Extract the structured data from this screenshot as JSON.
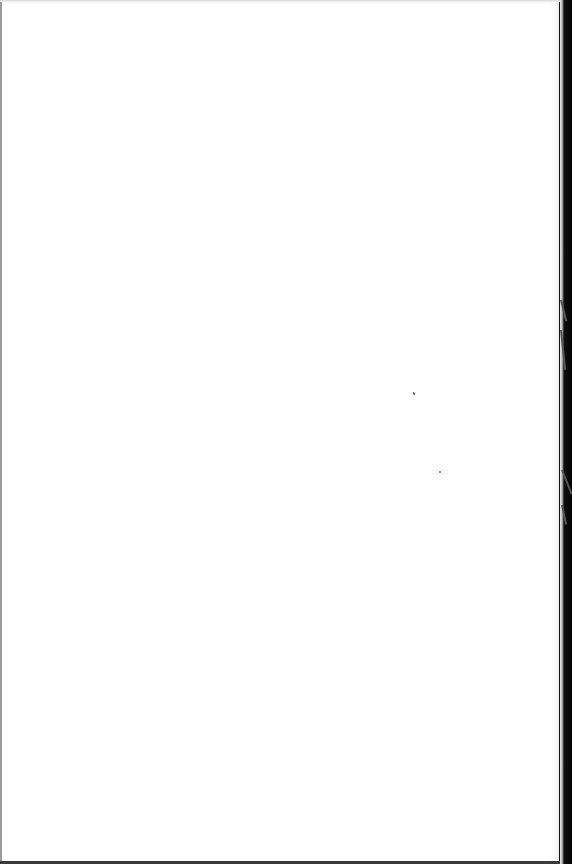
{
  "document": {
    "type": "scanned-blank-page",
    "content_text": "",
    "background_color": "#ffffff",
    "edge_color": "#000000"
  }
}
